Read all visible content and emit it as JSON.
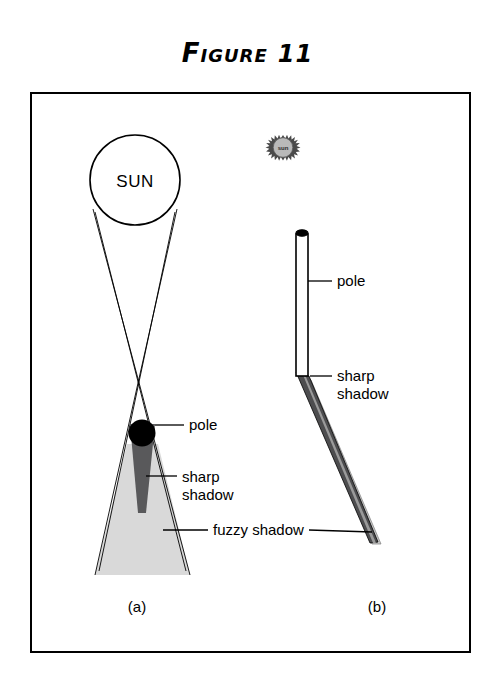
{
  "figure": {
    "title_word": "Figure",
    "title_number": "11",
    "frame": {
      "x": 31,
      "y": 93,
      "width": 439,
      "height": 559,
      "stroke": "#000000",
      "fill": "#ffffff"
    }
  },
  "colors": {
    "ink": "#000000",
    "umbra_fill": "#59595b",
    "penumbra_fill": "#d9d9d9",
    "penumbra_fill_b": "#c9c9c9",
    "pole_fill": "#000000",
    "pole_b_fill": "#ffffff",
    "background": "#ffffff"
  },
  "panel_a": {
    "caption": "(a)",
    "caption_pos": {
      "x": 137,
      "y": 612
    },
    "sun": {
      "label": "SUN",
      "cx": 135,
      "cy": 180,
      "r": 45,
      "label_x": 135,
      "label_y": 187
    },
    "pole": {
      "label": "pole",
      "cx": 142,
      "cy": 433,
      "r": 13.5,
      "label_x": 189,
      "label_y": 430,
      "leader": {
        "x1": 155,
        "y1": 425,
        "x2": 184,
        "y2": 425
      }
    },
    "sharp_shadow": {
      "label_line1": "sharp",
      "label_line2": "shadow",
      "label_x": 182,
      "label_y": 479,
      "leader": {
        "x1": 146,
        "y1": 475,
        "x2": 177,
        "y2": 475
      }
    },
    "fuzzy_shadow": {
      "label": "fuzzy shadow",
      "label_x": 213,
      "label_y": 534,
      "leader": {
        "x1": 165,
        "y1": 530,
        "x2": 208,
        "y2": 530
      }
    },
    "umbra_polygon": "130,424 155,424 146,513 138,513",
    "penumbra_polygon": "127,444 158,444 190,575 95,575",
    "rays": [
      {
        "x1": 93,
        "y1": 209,
        "x2": 190,
        "y2": 575
      },
      {
        "x1": 95,
        "y1": 212,
        "x2": 186,
        "y2": 571
      },
      {
        "x1": 177,
        "y1": 209,
        "x2": 95,
        "y2": 575
      },
      {
        "x1": 175,
        "y1": 212,
        "x2": 99,
        "y2": 571
      }
    ]
  },
  "panel_b": {
    "caption": "(b)",
    "caption_pos": {
      "x": 377,
      "y": 612
    },
    "sun_icon": {
      "label": "sun",
      "cx": 283,
      "cy": 149,
      "r_outer": 14,
      "r_inner": 10.5,
      "spikes": 22
    },
    "pole": {
      "label": "pole",
      "x": 296,
      "y_top": 232,
      "y_bottom": 376,
      "width": 12,
      "label_x": 337,
      "label_y": 286,
      "leader": {
        "x1": 308,
        "y1": 281,
        "x2": 332,
        "y2": 281
      }
    },
    "sharp_shadow": {
      "label_line1": "sharp",
      "label_line2": "shadow",
      "label_x": 337,
      "label_y": 380,
      "leader": {
        "x1": 310,
        "y1": 376,
        "x2": 332,
        "y2": 376
      }
    },
    "fuzzy_shadow_leader": {
      "x1": 307,
      "y1": 530,
      "x2": 371,
      "y2": 530
    },
    "umbra_polygon": "296,372 309,376 378,542 370,543",
    "penumbra_polygon": "303,376 311,380 381,544 372,544"
  }
}
